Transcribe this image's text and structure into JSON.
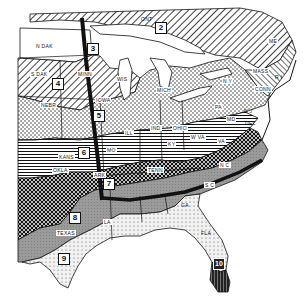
{
  "map": {
    "title": "",
    "colors": {
      "ink": "#111111",
      "paper": "#ffffff",
      "zone8": "#9a9a9a",
      "zone7": "#555555"
    },
    "zones": [
      {
        "id": "2",
        "label": "2"
      },
      {
        "id": "3",
        "label": "3"
      },
      {
        "id": "4",
        "label": "4"
      },
      {
        "id": "5",
        "label": "5"
      },
      {
        "id": "6",
        "label": "6"
      },
      {
        "id": "7",
        "label": "7"
      },
      {
        "id": "8",
        "label": "8"
      },
      {
        "id": "9",
        "label": "9"
      },
      {
        "id": "10",
        "label": "10"
      }
    ],
    "state_labels": {
      "ont": "ONT",
      "n_dak": "N DAK",
      "s_dak": "S DAK",
      "minn": "MINN",
      "wis": "WIS",
      "nebr": "NEBR",
      "iowa": "IOWA",
      "mich": "MICH",
      "ill": "ILL",
      "ind": "IND",
      "ohio": "OHIO",
      "pa": "PA",
      "ny": "N Y",
      "mass": "MASS",
      "ri": "R I",
      "conn": "CONN",
      "nj": "N J",
      "del": "DEL",
      "md": "MD",
      "me": "ME",
      "w_va": "W VA",
      "va": "VA",
      "ky": "KY",
      "kans": "KANS",
      "mo": "MO",
      "okla": "OKLA",
      "ark": "ARK",
      "tenn": "TENN",
      "nc": "N C",
      "sc": "S C",
      "ga": "GA",
      "la": "LA",
      "texas": "TEXAS",
      "fla": "FLA"
    }
  }
}
